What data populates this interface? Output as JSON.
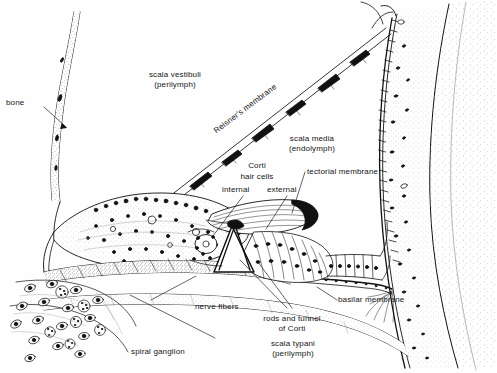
{
  "figure": {
    "ink_color": "#111111",
    "background_color": "#ffffff",
    "width": 497,
    "height": 373
  },
  "labels": {
    "bone": "bone",
    "scala_vestibuli_l1": "scala vestibuli",
    "scala_vestibuli_l2": "(perilymph)",
    "reisners_membrane": "Reisner's membrane",
    "scala_media_l1": "scala media",
    "scala_media_l2": "(endolymph)",
    "corti": "Corti",
    "hair_cells": "hair cells",
    "internal": "internal",
    "external": "external",
    "tectorial_membrane": "tectorial membrane",
    "basilar_membrane": "basilar membrane",
    "nerve_fibers": "nerve fibers",
    "rods_tunnel_l1": "rods and tunnel",
    "rods_tunnel_l2": "of Corti",
    "scala_typani_l1": "scala typani",
    "scala_typani_l2": "(perilymph)",
    "spiral_ganglion": "spiral ganglion"
  }
}
